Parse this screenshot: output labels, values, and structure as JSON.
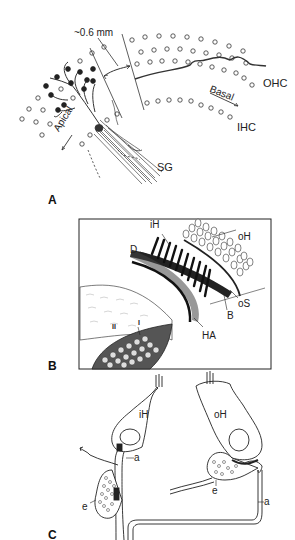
{
  "figure": {
    "panels": [
      {
        "id": "A",
        "letter": "A",
        "labels": {
          "scale": "~0.6 mm",
          "apical": "Apical",
          "basal": "Basal",
          "ohc": "OHC",
          "ihc": "IHC",
          "sg": "SG"
        }
      },
      {
        "id": "B",
        "letter": "B",
        "labels": {
          "ih": "iH",
          "oh": "oH",
          "d": "D",
          "os": "oS",
          "b": "B",
          "ha": "HA",
          "ii": "II",
          "i": "I"
        }
      },
      {
        "id": "C",
        "letter": "C",
        "labels": {
          "ih": "iH",
          "oh": "oH",
          "a_left": "a",
          "a_right": "a",
          "e_left": "e",
          "e_right": "e"
        }
      }
    ]
  },
  "colors": {
    "ink": "#1a1a1a",
    "background": "#ffffff"
  }
}
